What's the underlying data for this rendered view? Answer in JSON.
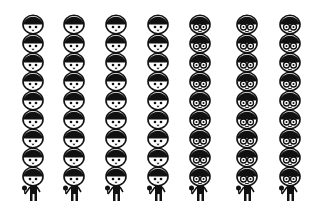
{
  "figure": {
    "type": "pictogram",
    "groups": [
      {
        "name": "no-glasses",
        "columns": 4,
        "heads_per_column": 9,
        "style": "plain"
      },
      {
        "name": "glasses",
        "columns": 3,
        "heads_per_column": 9,
        "style": "glasses"
      }
    ],
    "column_x_centers": [
      33,
      74,
      116,
      158,
      200,
      247,
      290
    ],
    "column_styles": [
      "plain",
      "plain",
      "plain",
      "plain",
      "glasses",
      "glasses",
      "glasses"
    ],
    "colors": {
      "ink": "#111111",
      "background": "#ffffff"
    }
  }
}
